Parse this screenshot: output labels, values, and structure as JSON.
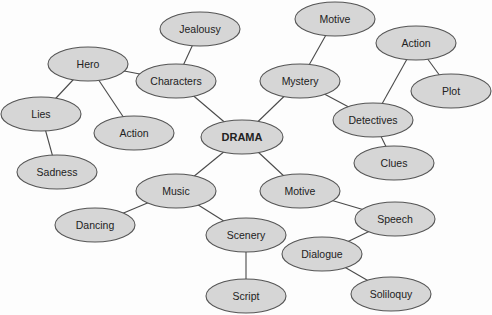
{
  "diagram": {
    "type": "mind-map",
    "center": "DRAMA",
    "style": {
      "node_fill": "#d6d6d6",
      "node_stroke": "#555555",
      "edge_color": "#4a4a4a",
      "text_color": "#222222",
      "background": "#fdfdfd"
    },
    "nodes": [
      {
        "id": "drama",
        "label": "DRAMA",
        "x": 242,
        "y": 137,
        "rx": 41,
        "ry": 17,
        "center": true
      },
      {
        "id": "characters",
        "label": "Characters",
        "x": 176,
        "y": 81,
        "rx": 40,
        "ry": 17
      },
      {
        "id": "jealousy",
        "label": "Jealousy",
        "x": 200,
        "y": 29,
        "rx": 40,
        "ry": 17
      },
      {
        "id": "hero",
        "label": "Hero",
        "x": 88,
        "y": 64,
        "rx": 40,
        "ry": 17
      },
      {
        "id": "lies",
        "label": "Lies",
        "x": 41,
        "y": 114,
        "rx": 40,
        "ry": 17
      },
      {
        "id": "sadness",
        "label": "Sadness",
        "x": 57,
        "y": 172,
        "rx": 40,
        "ry": 17
      },
      {
        "id": "action-left",
        "label": "Action",
        "x": 134,
        "y": 133,
        "rx": 40,
        "ry": 17
      },
      {
        "id": "mystery",
        "label": "Mystery",
        "x": 300,
        "y": 81,
        "rx": 40,
        "ry": 17
      },
      {
        "id": "motive-top",
        "label": "Motive",
        "x": 335,
        "y": 19,
        "rx": 40,
        "ry": 17
      },
      {
        "id": "detectives",
        "label": "Detectives",
        "x": 373,
        "y": 120,
        "rx": 40,
        "ry": 17
      },
      {
        "id": "action-right",
        "label": "Action",
        "x": 416,
        "y": 43,
        "rx": 40,
        "ry": 17
      },
      {
        "id": "plot",
        "label": "Plot",
        "x": 451,
        "y": 91,
        "rx": 40,
        "ry": 17
      },
      {
        "id": "clues",
        "label": "Clues",
        "x": 394,
        "y": 163,
        "rx": 40,
        "ry": 17
      },
      {
        "id": "music",
        "label": "Music",
        "x": 176,
        "y": 191,
        "rx": 40,
        "ry": 17
      },
      {
        "id": "dancing",
        "label": "Dancing",
        "x": 95,
        "y": 225,
        "rx": 40,
        "ry": 17
      },
      {
        "id": "scenery",
        "label": "Scenery",
        "x": 246,
        "y": 235,
        "rx": 40,
        "ry": 17
      },
      {
        "id": "script",
        "label": "Script",
        "x": 246,
        "y": 296,
        "rx": 40,
        "ry": 17
      },
      {
        "id": "motive-bottom",
        "label": "Motive",
        "x": 300,
        "y": 191,
        "rx": 40,
        "ry": 17
      },
      {
        "id": "speech",
        "label": "Speech",
        "x": 395,
        "y": 219,
        "rx": 40,
        "ry": 17
      },
      {
        "id": "dialogue",
        "label": "Dialogue",
        "x": 322,
        "y": 254,
        "rx": 40,
        "ry": 17
      },
      {
        "id": "soliloquy",
        "label": "Soliloquy",
        "x": 391,
        "y": 294,
        "rx": 40,
        "ry": 17
      }
    ],
    "edges": [
      [
        "drama",
        "characters"
      ],
      [
        "characters",
        "jealousy"
      ],
      [
        "characters",
        "hero"
      ],
      [
        "hero",
        "lies"
      ],
      [
        "hero",
        "action-left"
      ],
      [
        "lies",
        "sadness"
      ],
      [
        "drama",
        "mystery"
      ],
      [
        "mystery",
        "motive-top"
      ],
      [
        "mystery",
        "detectives"
      ],
      [
        "detectives",
        "action-right"
      ],
      [
        "action-right",
        "plot"
      ],
      [
        "detectives",
        "clues"
      ],
      [
        "drama",
        "music"
      ],
      [
        "music",
        "dancing"
      ],
      [
        "music",
        "scenery"
      ],
      [
        "scenery",
        "script"
      ],
      [
        "drama",
        "motive-bottom"
      ],
      [
        "motive-bottom",
        "speech"
      ],
      [
        "speech",
        "dialogue"
      ],
      [
        "dialogue",
        "soliloquy"
      ]
    ]
  }
}
